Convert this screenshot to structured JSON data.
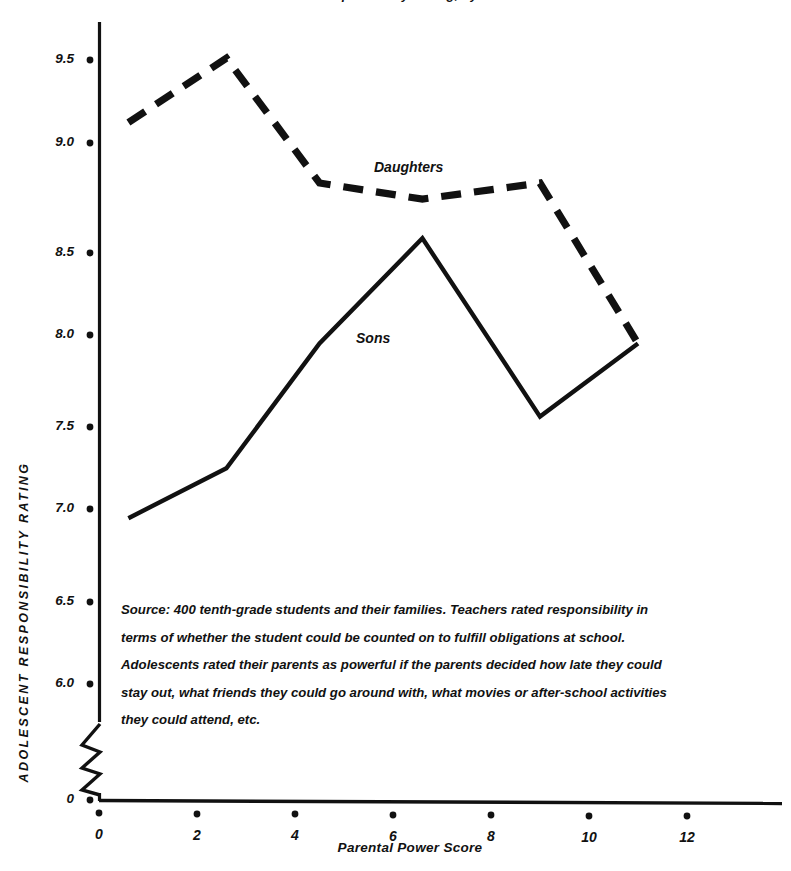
{
  "chart_data": {
    "type": "line",
    "title": "Adolescent Responsibility Rating, by Parental Power",
    "xlabel": "Parental Power Score",
    "ylabel": "ADOLESCENT RESPONSIBILITY RATING",
    "xlim": [
      0,
      13.5
    ],
    "ylim": [
      5.75,
      9.75
    ],
    "y_axis_broken": true,
    "y_axis_break_symbol": "zigzag",
    "grid": false,
    "legend_position": "inline-annotations",
    "xticks": [
      0,
      2,
      4,
      6,
      8,
      10,
      12
    ],
    "xtick_labels": [
      "0",
      "2",
      "4",
      "6",
      "8",
      "10",
      "12"
    ],
    "yticks": [
      6.0,
      6.5,
      7.0,
      7.5,
      8.0,
      8.5,
      9.0,
      9.5
    ],
    "ytick_labels": [
      "6.0",
      "6.5",
      "7.0",
      "7.5",
      "8.0",
      "8.5",
      "9.0",
      "9.5"
    ],
    "y_origin_label": "0",
    "series": [
      {
        "name": "Daughters",
        "style": "dashed",
        "color": "#111111",
        "x": [
          0.6,
          2.6,
          4.5,
          6.6,
          9.0,
          11.0
        ],
        "values": [
          9.15,
          9.51,
          8.81,
          8.72,
          8.81,
          7.91
        ]
      },
      {
        "name": "Sons",
        "style": "solid",
        "color": "#111111",
        "x": [
          0.6,
          2.6,
          4.5,
          6.6,
          9.0,
          11.0
        ],
        "values": [
          6.93,
          7.21,
          7.91,
          8.5,
          7.5,
          7.91
        ]
      }
    ],
    "annotations": [
      {
        "text": "Daughters",
        "x": 6.0,
        "y": 8.95
      },
      {
        "text": "Sons",
        "x": 5.3,
        "y": 8.05
      }
    ],
    "source_note": "Source: 400 tenth-grade students and their families. Teachers rated responsibility in terms of whether the student could be counted on to fulfill obligations at school. Adolescents rated their parents as powerful if the parents decided how late they could stay out, what friends they could go around with, what movies or after-school activities they could attend, etc."
  },
  "labels": {
    "title": "Adolescent Responsibility Rating, by Parental Power",
    "y_axis": "ADOLESCENT RESPONSIBILITY RATING",
    "x_axis": "Parental Power Score",
    "series_daughters": "Daughters",
    "series_sons": "Sons",
    "origin": "0",
    "ytick_0": "9.5",
    "ytick_1": "9.0",
    "ytick_2": "8.5",
    "ytick_3": "8.0",
    "ytick_4": "7.5",
    "ytick_5": "7.0",
    "ytick_6": "6.5",
    "ytick_7": "6.0",
    "xtick_0": "0",
    "xtick_1": "2",
    "xtick_2": "4",
    "xtick_3": "6",
    "xtick_4": "8",
    "xtick_5": "10",
    "xtick_6": "12",
    "source_note": "Source: 400 tenth-grade students and their families. Teachers rated responsibility in terms of whether the student could be counted on to fulfill obligations at school. Adolescents rated their parents as powerful if the parents decided how late they could stay out, what friends they could go around with, what movies or after-school activities they could attend, etc."
  }
}
